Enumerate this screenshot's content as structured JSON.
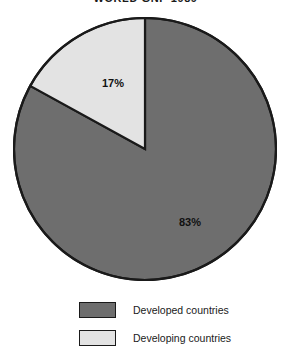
{
  "chart_data": {
    "type": "pie",
    "title": "WORLD GNP 1989",
    "xlabel": "",
    "ylabel": "",
    "grid": false,
    "legend_position": "bottom",
    "start_angle_deg": 0,
    "direction": "clockwise",
    "categories": [
      "Developed countries",
      "Developing countries"
    ],
    "values": [
      83,
      17
    ],
    "value_labels": [
      "83%",
      "17%"
    ],
    "colors": [
      "#6e6e6e",
      "#e3e3e3"
    ],
    "slices": [
      {
        "name": "Developed countries",
        "value": 83,
        "label": "83%",
        "color": "#6e6e6e",
        "label_x": 190,
        "label_y": 222
      },
      {
        "name": "Developing countries",
        "value": 17,
        "label": "17%",
        "color": "#e3e3e3",
        "label_x": 113,
        "label_y": 83
      }
    ]
  },
  "title": {
    "text": "WORLD GNP 1989"
  },
  "pie": {
    "outline_color": "#1a1a1a",
    "center_x": 145,
    "center_y": 149,
    "radius": 131,
    "label_developed": "83%",
    "label_developing": "17%"
  },
  "legend": {
    "items": [
      {
        "label": "Developed countries",
        "color": "#6e6e6e"
      },
      {
        "label": "Developing countries",
        "color": "#e3e3e3"
      }
    ]
  }
}
